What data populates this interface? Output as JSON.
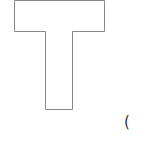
{
  "diagram": {
    "shape": "T-section outline",
    "stroke_color": "#888888",
    "fill_color": "#ffffff",
    "points": [
      [
        14,
        0
      ],
      [
        104,
        0
      ],
      [
        104,
        31
      ],
      [
        72,
        31
      ],
      [
        72,
        109
      ],
      [
        45,
        109
      ],
      [
        45,
        31
      ],
      [
        14,
        31
      ]
    ]
  },
  "annotation": {
    "text": "("
  }
}
